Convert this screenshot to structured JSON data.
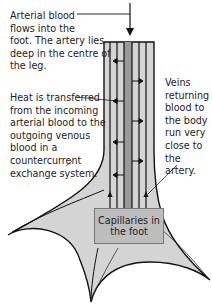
{
  "diagram": {
    "labels": {
      "arterial": "Arterial blood\nflows into the\nfoot. The artery lies\ndeep in the centre of\nthe leg.",
      "heat": "Heat is transferred\nfrom the incoming\narterial blood to the\noutgoing venous\nblood in a\ncountercurrent\nexchange system.",
      "veins": "Veins\nreturning\nblood to\nthe body\nrun very\nclose to\nthe artery.",
      "capillaries": "Capillaries in\nthe foot"
    },
    "colors": {
      "leg_fill": "#d4d4d4",
      "artery_fill": "#9a9a9a",
      "outline": "#111111",
      "box_fill": "#bdbdbd"
    }
  }
}
